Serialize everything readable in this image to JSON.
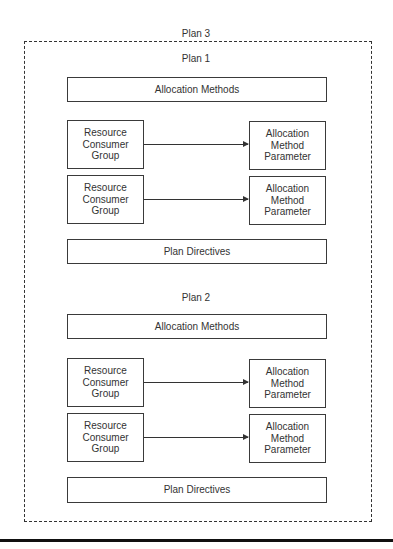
{
  "diagram": {
    "outer_plan": {
      "label": "Plan 3"
    },
    "plans": [
      {
        "label": "Plan 1",
        "allocation_methods": "Allocation Methods",
        "mappings": [
          {
            "group": "Resource\nConsumer\nGroup",
            "parameter": "Allocation\nMethod\nParameter"
          },
          {
            "group": "Resource\nConsumer\nGroup",
            "parameter": "Allocation\nMethod\nParameter"
          }
        ],
        "plan_directives": "Plan Directives"
      },
      {
        "label": "Plan 2",
        "allocation_methods": "Allocation Methods",
        "mappings": [
          {
            "group": "Resource\nConsumer\nGroup",
            "parameter": "Allocation\nMethod\nParameter"
          },
          {
            "group": "Resource\nConsumer\nGroup",
            "parameter": "Allocation\nMethod\nParameter"
          }
        ],
        "plan_directives": "Plan Directives"
      }
    ],
    "colors": {
      "line": "#333333",
      "rule": "#111111",
      "background": "#ffffff"
    }
  }
}
